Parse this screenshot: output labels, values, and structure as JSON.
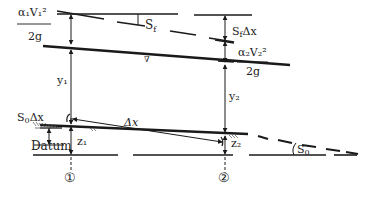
{
  "diagram": {
    "type": "open-channel-energy-diagram",
    "colors": {
      "line": "#1a1a1a",
      "background": "#ffffff"
    },
    "labels": {
      "velocity_head_1_num": "α₁V₁²",
      "velocity_head_1_den": "2g",
      "velocity_head_2_num": "α₂V₂²",
      "velocity_head_2_den": "2g",
      "friction_slope": "Sf",
      "head_loss": "SfΔx",
      "depth_1": "y₁",
      "depth_2": "y₂",
      "bed_drop": "S₀Δx",
      "reach_length": "Δx",
      "datum": "Datum",
      "elevation_1": "z₁",
      "elevation_2": "z₂",
      "bed_slope": "S₀",
      "section_1": "①",
      "section_2": "②",
      "water_surface_symbol": "∇"
    },
    "lines": [
      "energy grade line (slope Sf)",
      "horizontal reference line",
      "water surface",
      "channel bed (slope S0)",
      "datum"
    ],
    "sections": [
      "1",
      "2"
    ]
  }
}
